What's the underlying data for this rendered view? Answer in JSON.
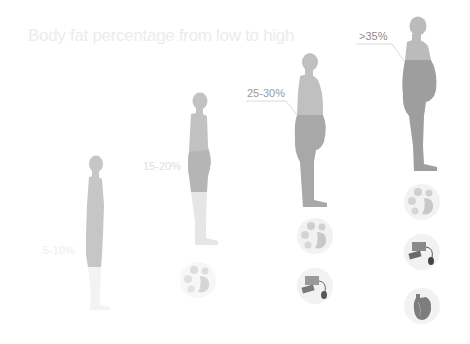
{
  "title": "Body fat percentage from low to high",
  "figures": [
    {
      "id": "low",
      "label": "5-10%",
      "label_color": "#f0f0f0",
      "body_color": "#c4c4c4",
      "fat_color": "#c4c4c4",
      "leg_color": "#f3f3f3"
    },
    {
      "id": "moderate",
      "label": "15-20%",
      "label_color": "#e6e6e6",
      "body_color": "#c2c2c2",
      "fat_color": "#b5b5b5",
      "leg_color": "#e6e6e6"
    },
    {
      "id": "high",
      "label": "25-30%",
      "label_color": "#a0a0a0",
      "body_color": "#bdbdbd",
      "fat_color": "#a6a6a6",
      "leg_color": "#a6a6a6"
    },
    {
      "id": "obese",
      "label": ">35%",
      "label_color": "#8c8c8c",
      "body_color": "#b8b8b8",
      "fat_color": "#9c9c9c",
      "leg_color": "#9c9c9c"
    }
  ],
  "health_icons": {
    "moderate": [
      "digestive-organs-icon"
    ],
    "high": [
      "digestive-organs-icon",
      "blood-pressure-monitor-icon"
    ],
    "obese": [
      "digestive-organs-icon",
      "blood-pressure-monitor-icon",
      "heart-icon"
    ]
  }
}
